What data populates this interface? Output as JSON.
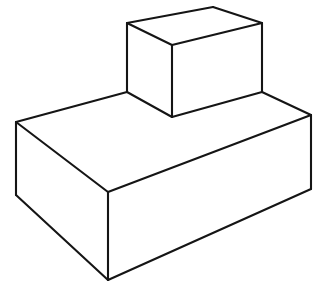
{
  "figure": {
    "background_color": "#ffffff",
    "stroke_color": "#151515",
    "stroke_width": 2.1,
    "canvas": {
      "width": 326,
      "height": 290
    },
    "solids": [
      {
        "name": "top-box",
        "label": "Small upper box",
        "fill_color": "#ffffff",
        "vertices": {
          "top_left": [
            127,
            23
          ],
          "top_back": [
            213,
            7
          ],
          "top_right": [
            262,
            23
          ],
          "top_front": [
            172,
            45
          ],
          "bottom_front": [
            172,
            117
          ],
          "bottom_left": [
            127,
            92
          ],
          "bottom_right": [
            262,
            92
          ]
        },
        "faces": [
          {
            "name": "top-face",
            "points": "127,23 213,7 262,23 172,45"
          },
          {
            "name": "left-face",
            "points": "127,23 172,45 172,117 127,92"
          },
          {
            "name": "right-face",
            "points": "172,45 262,23 262,92 172,117"
          }
        ],
        "edges": [
          {
            "name": "top-left-back-edge",
            "from": [
              127,
              23
            ],
            "to": [
              213,
              7
            ]
          },
          {
            "name": "top-right-back-edge",
            "from": [
              213,
              7
            ],
            "to": [
              262,
              23
            ]
          },
          {
            "name": "top-left-front-edge",
            "from": [
              127,
              23
            ],
            "to": [
              172,
              45
            ]
          },
          {
            "name": "top-right-front-edge",
            "from": [
              172,
              45
            ],
            "to": [
              262,
              23
            ]
          },
          {
            "name": "front-vertical-edge",
            "from": [
              172,
              45
            ],
            "to": [
              172,
              117
            ]
          },
          {
            "name": "left-vertical-edge",
            "from": [
              127,
              23
            ],
            "to": [
              127,
              92
            ]
          },
          {
            "name": "right-vertical-edge",
            "from": [
              262,
              23
            ],
            "to": [
              262,
              92
            ]
          },
          {
            "name": "bottom-left-front-edge",
            "from": [
              127,
              92
            ],
            "to": [
              172,
              117
            ]
          },
          {
            "name": "bottom-right-front-edge",
            "from": [
              172,
              117
            ],
            "to": [
              262,
              92
            ]
          }
        ]
      },
      {
        "name": "bottom-slab",
        "label": "Large lower slab",
        "fill_color": "#ffffff",
        "vertices": {
          "top_left": [
            16,
            122
          ],
          "top_right": [
            311,
            115
          ],
          "top_front": [
            108,
            192
          ],
          "bottom_front": [
            108,
            280
          ],
          "bottom_left": [
            16,
            195
          ],
          "bottom_right": [
            311,
            189
          ],
          "shelf_left": [
            127,
            92
          ],
          "shelf_right": [
            262,
            92
          ]
        },
        "faces": [
          {
            "name": "top-face",
            "points": "16,122 127,92 262,92 311,115 108,192"
          },
          {
            "name": "left-face",
            "points": "16,122 108,192 108,280 16,195"
          },
          {
            "name": "right-face",
            "points": "108,192 311,115 311,189 108,280"
          }
        ],
        "edges": [
          {
            "name": "top-back-left-edge",
            "from": [
              16,
              122
            ],
            "to": [
              127,
              92
            ]
          },
          {
            "name": "top-back-right-edge",
            "from": [
              262,
              92
            ],
            "to": [
              311,
              115
            ]
          },
          {
            "name": "top-front-left-edge",
            "from": [
              16,
              122
            ],
            "to": [
              108,
              192
            ]
          },
          {
            "name": "top-front-right-edge",
            "from": [
              108,
              192
            ],
            "to": [
              311,
              115
            ]
          },
          {
            "name": "front-vertical-edge",
            "from": [
              108,
              192
            ],
            "to": [
              108,
              280
            ]
          },
          {
            "name": "left-vertical-edge",
            "from": [
              16,
              122
            ],
            "to": [
              16,
              195
            ]
          },
          {
            "name": "right-vertical-edge",
            "from": [
              311,
              115
            ],
            "to": [
              311,
              189
            ]
          },
          {
            "name": "bottom-left-front-edge",
            "from": [
              16,
              195
            ],
            "to": [
              108,
              280
            ]
          },
          {
            "name": "bottom-right-front-edge",
            "from": [
              108,
              280
            ],
            "to": [
              311,
              189
            ]
          }
        ]
      }
    ]
  }
}
